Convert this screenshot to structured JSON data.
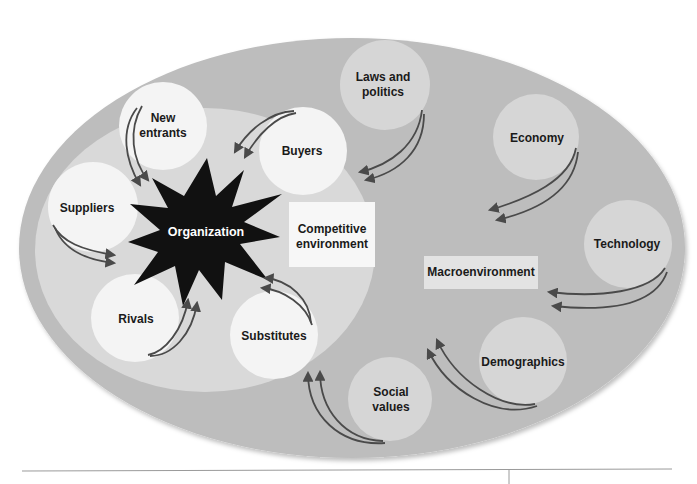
{
  "diagram": {
    "colors": {
      "outer_ellipse": "#bdbdbd",
      "inner_ellipse": "#d9d9d9",
      "white_circle": "#f4f4f4",
      "macro_circle": "#d6d6d6",
      "label_box": "#f7f7f7",
      "organization_star": "#111111",
      "arrow": "#4a4a4a"
    },
    "center": {
      "label": "Organization"
    },
    "competitive_environment": {
      "label_line1": "Competitive",
      "label_line2": "environment",
      "forces": [
        {
          "id": "new-entrants",
          "line1": "New",
          "line2": "entrants"
        },
        {
          "id": "buyers",
          "line1": "Buyers"
        },
        {
          "id": "suppliers",
          "line1": "Suppliers"
        },
        {
          "id": "rivals",
          "line1": "Rivals"
        },
        {
          "id": "substitutes",
          "line1": "Substitutes"
        }
      ]
    },
    "macroenvironment": {
      "label": "Macroenvironment",
      "forces": [
        {
          "id": "laws-and-politics",
          "line1": "Laws and",
          "line2": "politics"
        },
        {
          "id": "economy",
          "line1": "Economy"
        },
        {
          "id": "technology",
          "line1": "Technology"
        },
        {
          "id": "demographics",
          "line1": "Demographics"
        },
        {
          "id": "social-values",
          "line1": "Social",
          "line2": "values"
        }
      ]
    }
  }
}
